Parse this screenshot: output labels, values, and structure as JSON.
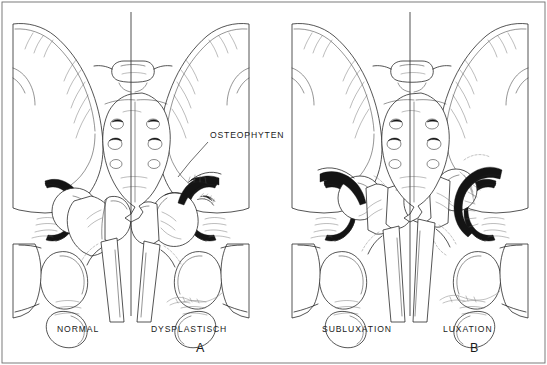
{
  "figure": {
    "kind": "anatomical-line-drawing",
    "background_color": "#ffffff",
    "ink_color": "#1a1a1a",
    "frame": {
      "visible": true,
      "color": "#6a6a6a",
      "inset_px": 2
    },
    "panels": [
      {
        "letter": "A",
        "letter_x": 196,
        "letter_y": 341,
        "midline_x": 131,
        "halves": [
          {
            "label": "NORMAL",
            "label_x": 57,
            "label_y": 324,
            "condition": "normal"
          },
          {
            "label": "DYSPLASTISCH",
            "label_x": 151,
            "label_y": 324,
            "condition": "dysplastic"
          }
        ]
      },
      {
        "letter": "B",
        "letter_x": 470,
        "letter_y": 341,
        "midline_x": 410,
        "halves": [
          {
            "label": "SUBLUXATION",
            "label_x": 322,
            "label_y": 324,
            "condition": "subluxation"
          },
          {
            "label": "LUXATION",
            "label_x": 443,
            "label_y": 324,
            "condition": "luxation"
          }
        ]
      }
    ],
    "annotations": [
      {
        "text": "OSTEOPHYTEN",
        "x": 210,
        "y": 130,
        "leader_line": {
          "from_x": 208,
          "from_y": 142,
          "to_x": 178,
          "to_y": 177
        }
      }
    ],
    "signatures": [
      {
        "panel": "A",
        "x": 168,
        "y": 300
      },
      {
        "panel": "B",
        "x": 440,
        "y": 298
      }
    ],
    "dividers": [
      {
        "x": 131,
        "y_top": 12,
        "y_bottom": 316
      },
      {
        "x": 410,
        "y_top": 12,
        "y_bottom": 316
      }
    ]
  }
}
